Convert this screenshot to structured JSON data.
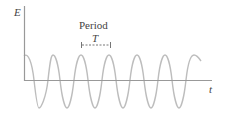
{
  "diagram": {
    "y_axis_label": "E",
    "x_axis_label": "t",
    "period_label": "Period",
    "period_symbol": "T",
    "colors": {
      "axis": "#999999",
      "wave": "#bdbdbd",
      "text": "#444444"
    }
  }
}
